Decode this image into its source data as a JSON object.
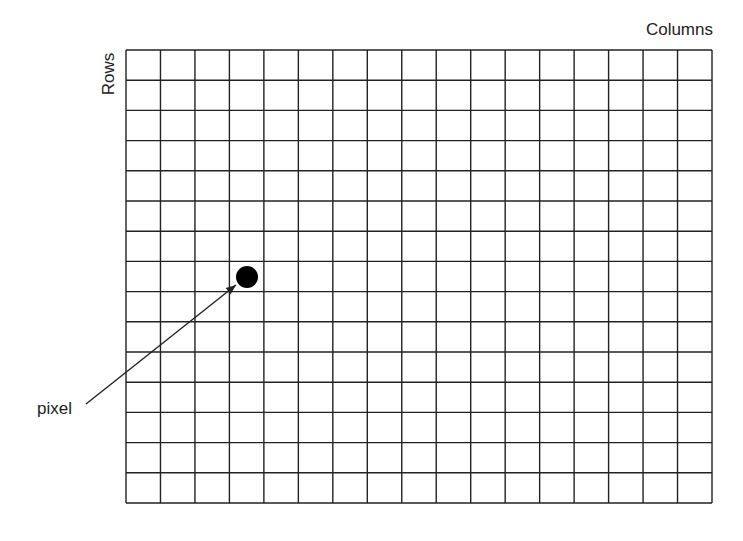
{
  "labels": {
    "columns": "Columns",
    "rows": "Rows",
    "pixel": "pixel"
  },
  "grid": {
    "columns": 17,
    "rows": 15,
    "left": 126,
    "top": 50,
    "right": 712,
    "bottom": 503,
    "line_color": "#222222"
  },
  "highlighted_pixel": {
    "column": 4,
    "row": 8,
    "cx": 247,
    "cy": 277,
    "radius": 11,
    "color": "#000000"
  },
  "arrow": {
    "from": [
      86,
      404
    ],
    "to": [
      236,
      285
    ]
  }
}
